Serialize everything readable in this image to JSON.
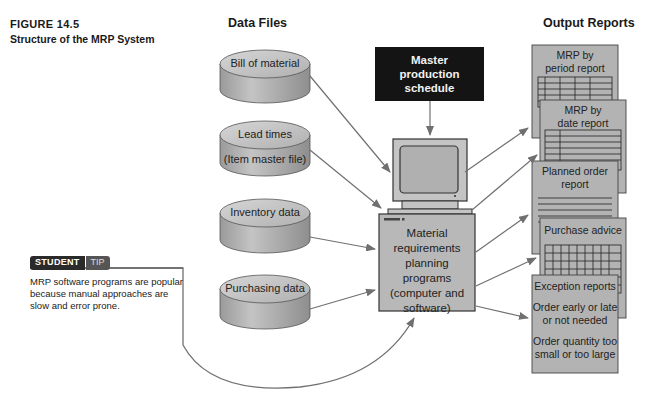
{
  "figure": {
    "number": "FIGURE 14.5",
    "title": "Structure of the MRP System"
  },
  "columns": {
    "data_files": "Data Files",
    "output_reports": "Output Reports"
  },
  "data_files": [
    {
      "line1": "Bill of material",
      "line2": ""
    },
    {
      "line1": "Lead times",
      "line2": "(Item master file)"
    },
    {
      "line1": "Inventory data",
      "line2": ""
    },
    {
      "line1": "Purchasing data",
      "line2": ""
    }
  ],
  "master_schedule": {
    "line1": "Master",
    "line2": "production schedule"
  },
  "mrp_program": {
    "lines": [
      "Material",
      "requirements",
      "planning",
      "programs",
      "(computer and",
      "software)"
    ]
  },
  "reports": [
    {
      "line1": "MRP by",
      "line2": "period report"
    },
    {
      "line1": "MRP by",
      "line2": "date report"
    },
    {
      "line1": "Planned order",
      "line2": "report"
    },
    {
      "line1": "Purchase advice",
      "line2": ""
    },
    {
      "title": "Exception reports",
      "item1a": "Order early or late",
      "item1b": "or not needed",
      "item2a": "Order quantity too",
      "item2b": "small or too large"
    }
  ],
  "student_tip": {
    "badge_student": "STUDENT",
    "badge_tip": "TIP",
    "text": "MRP software programs are popular because manual approaches are slow and error prone."
  },
  "colors": {
    "cylinder_fill": "#b5b5b5",
    "cylinder_top": "#c8c8c8",
    "report_fill": "#b3b3b3",
    "mps_fill": "#141414",
    "arrow": "#666666"
  }
}
